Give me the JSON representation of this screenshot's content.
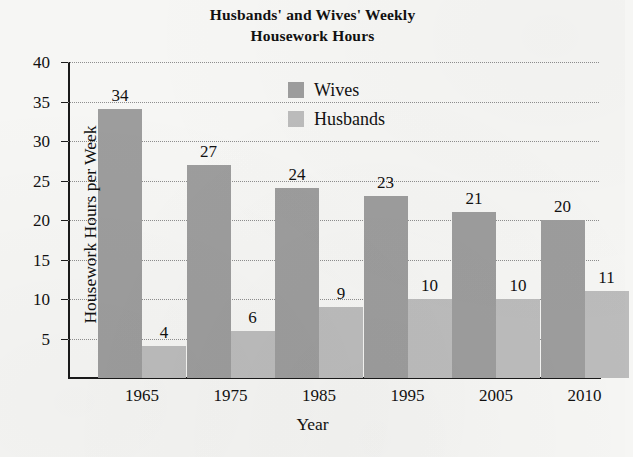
{
  "chart_data": {
    "type": "bar",
    "title": "Husbands' and Wives' Weekly Housework Hours",
    "title_lines": [
      "Husbands' and Wives' Weekly",
      "Housework Hours"
    ],
    "xlabel": "Year",
    "ylabel": "Housework Hours per Week",
    "categories": [
      "1965",
      "1975",
      "1985",
      "1995",
      "2005",
      "2010"
    ],
    "series": [
      {
        "name": "Wives",
        "color": "#9d9d9d",
        "values": [
          34,
          27,
          24,
          23,
          21,
          20
        ]
      },
      {
        "name": "Husbands",
        "color": "#bcbcbc",
        "values": [
          4,
          6,
          9,
          10,
          10,
          11
        ]
      }
    ],
    "ylim": [
      0,
      40
    ],
    "yticks": [
      5,
      10,
      15,
      20,
      25,
      30,
      35,
      40
    ],
    "ytick_labels": [
      "5",
      "10",
      "15",
      "20",
      "25",
      "30",
      "35",
      "40"
    ],
    "grid": true,
    "grid_style": "dotted-horizontal",
    "legend_position": "inside-top-center",
    "data_labels": true,
    "background_color": "#f6f6f4",
    "axis_color": "#1a1a1a"
  },
  "legend": {
    "entries": [
      {
        "label": "Wives"
      },
      {
        "label": "Husbands"
      }
    ]
  }
}
